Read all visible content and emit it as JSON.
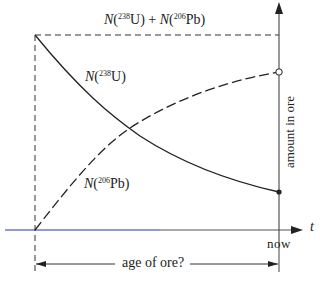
{
  "diagram": {
    "title_sum": {
      "n": "N",
      "open": "(",
      "iso1": "238",
      "el1": "U",
      "mid": ") + ",
      "n2": "N",
      "open2": "(",
      "iso2": "206",
      "el2": "Pb",
      "close": ")"
    },
    "uranium_label": {
      "n": "N",
      "open": "(",
      "iso": "238",
      "el": "U",
      "close": ")"
    },
    "lead_label": {
      "n": "N",
      "open": "(",
      "iso": "206",
      "el": "Pb",
      "close": ")"
    },
    "y_axis_label": "amount in ore",
    "x_axis_label": "t",
    "now_label": "now",
    "age_label": "age of ore?",
    "colors": {
      "line": "#2a2a2a",
      "time_axis": "#6f74d8"
    }
  }
}
